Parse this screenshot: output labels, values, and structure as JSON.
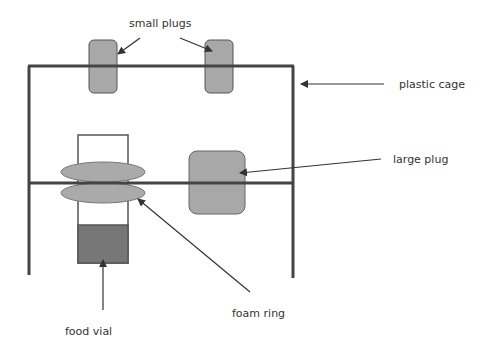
{
  "labels": {
    "small_plugs": "small plugs",
    "plastic_cage": "plastic cage",
    "large_plug": "large plug",
    "foam_ring": "foam ring",
    "food_vial": "food vial"
  },
  "colors": {
    "line": "#444444",
    "plug_fill": "#a8a8a8",
    "foam_fill": "#aaaaaa",
    "food_fill": "#777777",
    "text": "#333333"
  }
}
